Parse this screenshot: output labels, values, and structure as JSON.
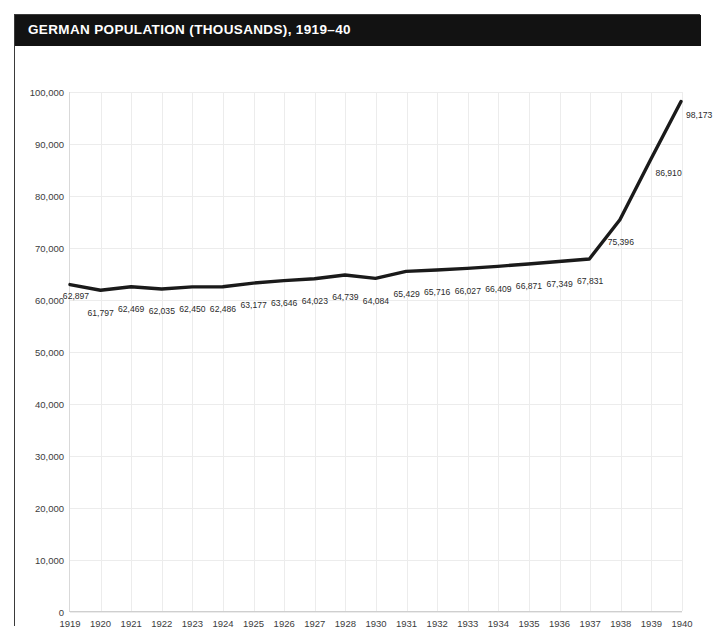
{
  "header": {
    "title": "GERMAN POPULATION (THOUSANDS), 1919–40"
  },
  "colors": {
    "title_bar_background": "#121212",
    "title_text": "#ffffff",
    "line": "#1a1a1a",
    "gridline": "#ececec",
    "plot_background": "#ffffff",
    "frame_border": "#3a3a3a",
    "tick_text": "#3c3c3c"
  },
  "axes": {
    "y_ticks": [
      "0",
      "10,000",
      "20,000",
      "30,000",
      "40,000",
      "50,000",
      "60,000",
      "70,000",
      "80,000",
      "90,000",
      "100,000"
    ],
    "x_ticks": [
      "1919",
      "1920",
      "1921",
      "1922",
      "1923",
      "1924",
      "1925",
      "1926",
      "1927",
      "1928",
      "1930",
      "1931",
      "1932",
      "1933",
      "1934",
      "1935",
      "1936",
      "1937",
      "1938",
      "1939",
      "1940"
    ]
  },
  "chart_data": {
    "type": "line",
    "title": "GERMAN POPULATION (THOUSANDS), 1919–40",
    "xlabel": "",
    "ylabel": "",
    "ylim": [
      0,
      100000
    ],
    "ytick_step": 10000,
    "grid": true,
    "legend": false,
    "categories": [
      "1919",
      "1920",
      "1921",
      "1922",
      "1923",
      "1924",
      "1925",
      "1926",
      "1927",
      "1928",
      "1930",
      "1931",
      "1932",
      "1933",
      "1934",
      "1935",
      "1936",
      "1937",
      "1938",
      "1939",
      "1940"
    ],
    "values": [
      62897,
      61797,
      62469,
      62035,
      62450,
      62486,
      63177,
      63646,
      64023,
      64739,
      64084,
      65429,
      65716,
      66027,
      66409,
      66871,
      67349,
      67831,
      75396,
      86910,
      98173
    ],
    "data_labels": [
      "62,897",
      "61,797",
      "62,469",
      "62,035",
      "62,450",
      "62,486",
      "63,177",
      "63,646",
      "64,023",
      "64,739",
      "64,084",
      "65,429",
      "65,716",
      "66,027",
      "66,409",
      "66,871",
      "67,349",
      "67,831",
      "75,396",
      "86,910",
      "98,173"
    ],
    "label_positions": [
      "above",
      "below",
      "below",
      "below",
      "below",
      "below",
      "below",
      "below",
      "below",
      "below",
      "below",
      "below",
      "below",
      "below",
      "below",
      "below",
      "below",
      "below",
      "below",
      "right",
      "right"
    ]
  }
}
